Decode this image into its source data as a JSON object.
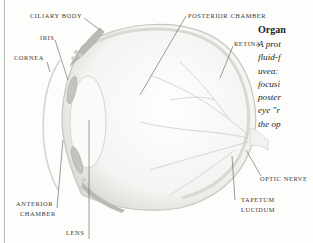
{
  "illustration": {
    "subject": "eye-cross-section",
    "labels": {
      "ciliary_body": "CILIARY BODY",
      "iris": "IRIS",
      "cornea": "CORNEA",
      "posterior_chamber": "POSTERIOR CHAMBER",
      "retina": "RETINA",
      "optic_nerve": "OPTIC NERVE",
      "anterior_chamber_line1": "ANTERIOR",
      "anterior_chamber_line2": "CHAMBER",
      "lens": "LENS",
      "tapetum_line1": "TAPETUM",
      "tapetum_line2": "LUCIDUM"
    }
  },
  "sidebar_text": {
    "title": "Organ",
    "lines": [
      "A prot",
      "fluid-f",
      "uvea: ",
      "focusi",
      "poster",
      "eye \"r",
      "the op"
    ]
  }
}
